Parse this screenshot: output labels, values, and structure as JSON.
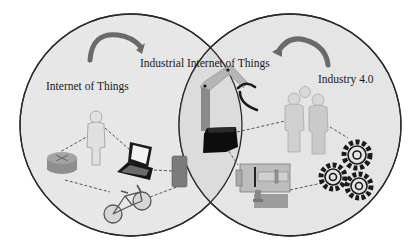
{
  "diagram": {
    "type": "venn",
    "sets": [
      {
        "id": "iot",
        "label": "Internet of Things",
        "icons": [
          "router-icon",
          "person-icon",
          "laptop-icon",
          "phone-icon",
          "bicycle-icon"
        ]
      },
      {
        "id": "industry40",
        "label": "Industry 4.0",
        "icons": [
          "people-group-icon",
          "gears-icon",
          "machine-icon"
        ]
      }
    ],
    "intersection": {
      "label": "Industrial Internet of Things",
      "icons": [
        "robot-arm-icon"
      ]
    },
    "colors": {
      "circle_fill": "#e6e6e6",
      "circle_stroke": "#2a2a2a",
      "arrow": "#666666",
      "connector": "#444444",
      "dark_device": "#111111",
      "grey_device": "#8a8a8a"
    }
  }
}
